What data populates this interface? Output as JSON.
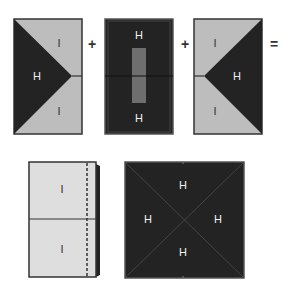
{
  "colors": {
    "dark": "#232323",
    "light": "#bdbdbd",
    "lighter": "#dedede",
    "stripe": "#6e6e6e",
    "outline": "#333333"
  },
  "equation": {
    "plus1": "+",
    "plus2": "+",
    "equals": "="
  },
  "panel1": {
    "label_top": "I",
    "label_mid": "H",
    "label_bot": "I"
  },
  "panel2": {
    "label_top": "H",
    "label_bot": "H"
  },
  "panel3": {
    "label_top": "I",
    "label_mid": "H",
    "label_bot": "I"
  },
  "panel4": {
    "label_top": "I",
    "label_bot": "I"
  },
  "panel5": {
    "label_top": "H",
    "label_left": "H",
    "label_right": "H",
    "label_bot": "H"
  }
}
